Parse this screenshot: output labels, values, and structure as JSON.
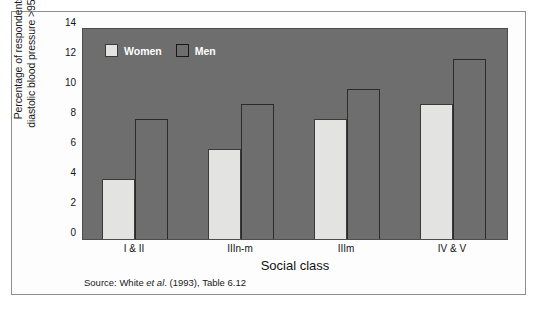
{
  "chart_data": {
    "type": "bar",
    "title": "",
    "categories": [
      "I & II",
      "IIIn-m",
      "IIIm",
      "IV & V"
    ],
    "series": [
      {
        "name": "Women",
        "values": [
          4,
          6,
          8,
          9
        ],
        "color": "#e3e3e1"
      },
      {
        "name": "Men",
        "values": [
          8,
          9,
          10,
          12
        ],
        "color": "#6e6e6e"
      }
    ],
    "xlabel": "Social class",
    "ylabel": "Percentage of respondents with diastolic blood pressure >95 mmHg",
    "ylabel_lines": [
      "Percentage of respondents with",
      "diastolic blood pressure >95 mmHg"
    ],
    "ylim": [
      0,
      14
    ],
    "ytick_values": [
      0,
      2,
      4,
      6,
      8,
      10,
      12,
      14
    ],
    "ytick_labels": [
      "0",
      "2",
      "4",
      "6",
      "8",
      "10",
      "12",
      "14"
    ],
    "grid": false,
    "legend_position": "top-left-inside",
    "plot_background": "#6e6e6e",
    "figure_background": "#ffffff"
  },
  "legend": {
    "items": [
      {
        "label": "Women",
        "swatch": "women"
      },
      {
        "label": "Men",
        "swatch": "men"
      }
    ]
  },
  "axes": {
    "x_title": "Social class",
    "y_title_line1": "Percentage of respondents with",
    "y_title_line2": "diastolic blood pressure >95 mmHg",
    "y_ticks": [
      "14",
      "12",
      "10",
      "8",
      "6",
      "4",
      "2",
      "0"
    ],
    "x_ticks": [
      "I & II",
      "IIIn-m",
      "IIIm",
      "IV & V"
    ]
  },
  "source": {
    "prefix": "Source: White ",
    "italic": "et al",
    "suffix": ". (1993), Table 6.12",
    "full": "Source: White et al. (1993), Table 6.12"
  }
}
